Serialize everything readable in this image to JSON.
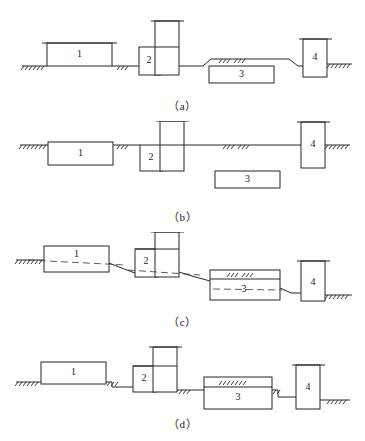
{
  "figure": {
    "type": "engineering-schematic",
    "background_color": "#ffffff",
    "line_color": "#262626",
    "dash_color": "#4a4a4a",
    "width": 365,
    "height": 441,
    "panels": [
      {
        "id": "a",
        "caption": "（a）",
        "caption_y": 97,
        "top": 10,
        "components": [
          {
            "name": "component-1",
            "label": "1",
            "shape": "wide-box-with-cap"
          },
          {
            "name": "component-2",
            "label": "2",
            "shape": "box-with-tower"
          },
          {
            "name": "component-3",
            "label": "3",
            "shape": "wide-box-below-grade"
          },
          {
            "name": "component-4",
            "label": "4",
            "shape": "tall-box-with-cap"
          }
        ],
        "ground_profile": "flat-with-raised-hump-over-3"
      },
      {
        "id": "b",
        "caption": "（b）",
        "caption_y": 208,
        "top": 121,
        "components": [
          {
            "name": "component-1",
            "label": "1",
            "shape": "wide-box"
          },
          {
            "name": "component-2",
            "label": "2",
            "shape": "box-with-tower"
          },
          {
            "name": "component-3",
            "label": "3",
            "shape": "detached-box-below-grade"
          },
          {
            "name": "component-4",
            "label": "4",
            "shape": "tall-box-with-cap"
          }
        ],
        "ground_profile": "flat-continuous"
      },
      {
        "id": "c",
        "caption": "（c）",
        "caption_y": 313,
        "top": 232,
        "components": [
          {
            "name": "component-1",
            "label": "1",
            "shape": "wide-box-with-dashed-axis"
          },
          {
            "name": "component-2",
            "label": "2",
            "shape": "box-with-tower"
          },
          {
            "name": "component-3",
            "label": "3",
            "shape": "wide-box-with-dashed-axis"
          },
          {
            "name": "component-4",
            "label": "4",
            "shape": "tall-box-with-cap"
          }
        ],
        "ground_profile": "descending-stepped-sloped"
      },
      {
        "id": "d",
        "caption": "（d）",
        "caption_y": 415,
        "top": 340,
        "components": [
          {
            "name": "component-1",
            "label": "1",
            "shape": "wide-box"
          },
          {
            "name": "component-2",
            "label": "2",
            "shape": "box-with-tower"
          },
          {
            "name": "component-3",
            "label": "3",
            "shape": "wide-box-with-top-chamber"
          },
          {
            "name": "component-4",
            "label": "4",
            "shape": "tall-box-with-cap"
          }
        ],
        "ground_profile": "descending-stepped"
      }
    ],
    "labels": {
      "one": "1",
      "two": "2",
      "three": "3",
      "four": "4"
    }
  }
}
